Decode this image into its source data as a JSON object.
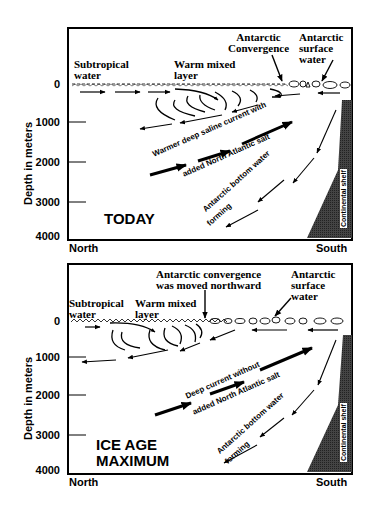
{
  "figure": {
    "axis": {
      "ylabel": "Depth in meters",
      "ticks": [
        "0",
        "1000",
        "2000",
        "3000",
        "4000"
      ],
      "x_left": "North",
      "x_right": "South"
    },
    "panels": [
      {
        "id": "today",
        "era_label": "TODAY",
        "labels": {
          "subtropical_1": "Subtropical",
          "subtropical_2": "water",
          "warm_1": "Warm mixed",
          "warm_2": "layer",
          "convergence_1": "Antarctic",
          "convergence_2": "Convergence",
          "surface_1": "Antarctic",
          "surface_2": "surface",
          "surface_3": "water",
          "deep_1": "Warmer deep saline current with",
          "deep_2": "added North Atlantic salt",
          "bottom_1": "Antarctic bottom water",
          "bottom_2": "forming",
          "shelf": "Continental shelf"
        }
      },
      {
        "id": "ice-age",
        "era_label_1": "ICE AGE",
        "era_label_2": "MAXIMUM",
        "labels": {
          "subtropical_1": "Subtropical",
          "subtropical_2": "water",
          "warm_1": "Warm mixed",
          "warm_2": "layer",
          "convergence_1": "Antarctic convergence",
          "convergence_2": "was moved northward",
          "surface_1": "Antarctic",
          "surface_2": "surface",
          "surface_3": "water",
          "deep_1": "Deep current without",
          "deep_2": "added North Atlantic salt",
          "bottom_1": "Antarctic bottom water",
          "bottom_2": "forming",
          "shelf": "Continental shelf"
        }
      }
    ]
  }
}
